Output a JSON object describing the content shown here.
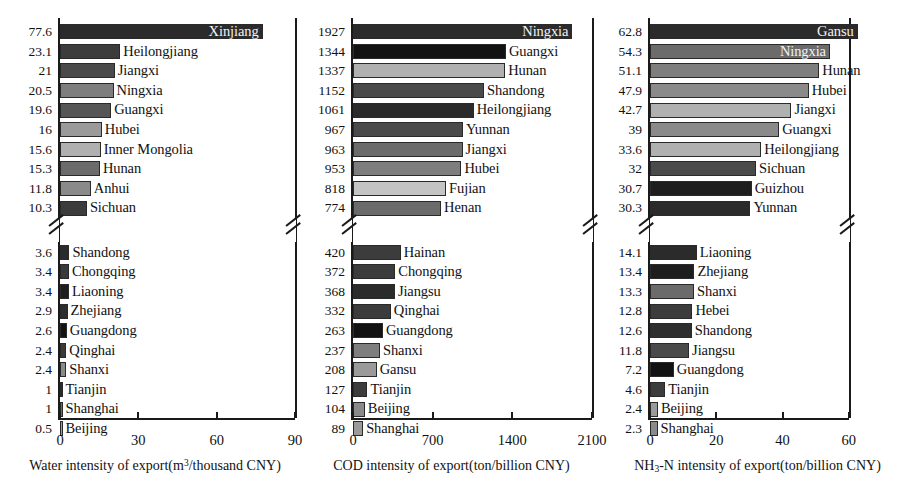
{
  "figure": {
    "background": "#ffffff",
    "n_panels": 3,
    "axis_color": "#1a1a1a"
  },
  "palette": {
    "g1": "#2b2b2b",
    "g2": "#3c3c3c",
    "g3": "#4a4a4a",
    "g4": "#565656",
    "g5": "#6b6b6b",
    "g6": "#7e7e7e",
    "g7": "#9a9a9a",
    "g8": "#b0b0b0",
    "g9": "#c4c4c4",
    "black": "#121212"
  },
  "chart_data": [
    {
      "type": "bar",
      "orientation": "horizontal",
      "id": "water-intensity",
      "title": "",
      "xlabel": "Water intensity of export(m3/thousand CNY)",
      "xlabel_parts": {
        "pre": "Water intensity of export(m",
        "sup": "3",
        "post": "/thousand CNY)"
      },
      "ylabel": "",
      "xlim": [
        0,
        90
      ],
      "xticks": [
        0,
        30,
        60,
        90
      ],
      "xticklabels": [
        "0",
        "30",
        "60",
        "90"
      ],
      "axis_break": true,
      "grid": false,
      "categories": [
        "Xinjiang",
        "Heilongjiang",
        "Jiangxi",
        "Ningxia",
        "Guangxi",
        "Hubei",
        "Inner Mongolia",
        "Hunan",
        "Anhui",
        "Sichuan",
        "Shandong",
        "Chongqing",
        "Liaoning",
        "Zhejiang",
        "Guangdong",
        "Qinghai",
        "Shanxi",
        "Tianjin",
        "Shanghai",
        "Beijing"
      ],
      "values": [
        77.6,
        23.1,
        21,
        20.5,
        19.6,
        16,
        15.6,
        15.3,
        11.8,
        10.3,
        3.6,
        3.4,
        3.4,
        2.9,
        2.6,
        2.4,
        2.4,
        1,
        1,
        0.5
      ],
      "value_labels": [
        "77.6",
        "23.1",
        "21",
        "20.5",
        "19.6",
        "16",
        "15.6",
        "15.3",
        "11.8",
        "10.3",
        "3.6",
        "3.4",
        "3.4",
        "2.9",
        "2.6",
        "2.4",
        "2.4",
        "1",
        "1",
        "0.5"
      ],
      "bar_colors": [
        "#2b2b2b",
        "#3c3c3c",
        "#4a4a4a",
        "#7e7e7e",
        "#565656",
        "#9a9a9a",
        "#b0b0b0",
        "#6b6b6b",
        "#8a8a8a",
        "#3c3c3c",
        "#2b2b2b",
        "#3a3a3a",
        "#1e1e1e",
        "#2e2e2e",
        "#141414",
        "#3a3a3a",
        "#8a8a8a",
        "#2b2b2b",
        "#6b6b6b",
        "#9a9a9a"
      ],
      "label_inside": [
        true,
        false,
        false,
        false,
        false,
        false,
        false,
        false,
        false,
        false,
        false,
        false,
        false,
        false,
        false,
        false,
        false,
        false,
        false,
        false
      ],
      "group_break_after": 9
    },
    {
      "type": "bar",
      "orientation": "horizontal",
      "id": "cod-intensity",
      "title": "",
      "xlabel": "COD intensity of export(ton/billion CNY)",
      "xlabel_parts": {
        "pre": "COD intensity of export(ton/billion CNY)",
        "sup": "",
        "post": ""
      },
      "ylabel": "",
      "xlim": [
        0,
        2100
      ],
      "xticks": [
        0,
        700,
        1400,
        2100
      ],
      "xticklabels": [
        "0",
        "700",
        "1400",
        "2100"
      ],
      "axis_break": true,
      "grid": false,
      "categories": [
        "Ningxia",
        "Guangxi",
        "Hunan",
        "Shandong",
        "Heilongjiang",
        "Yunnan",
        "Jiangxi",
        "Hubei",
        "Fujian",
        "Henan",
        "Hainan",
        "Chongqing",
        "Jiangsu",
        "Qinghai",
        "Guangdong",
        "Shanxi",
        "Gansu",
        "Tianjin",
        "Beijing",
        "Shanghai"
      ],
      "values": [
        1927,
        1344,
        1337,
        1152,
        1061,
        967,
        963,
        953,
        818,
        774,
        420,
        372,
        368,
        332,
        263,
        237,
        208,
        127,
        104,
        89
      ],
      "value_labels": [
        "1927",
        "1344",
        "1337",
        "1152",
        "1061",
        "967",
        "963",
        "953",
        "818",
        "774",
        "420",
        "372",
        "368",
        "332",
        "263",
        "237",
        "208",
        "127",
        "104",
        "89"
      ],
      "bar_colors": [
        "#2b2b2b",
        "#121212",
        "#b0b0b0",
        "#4a4a4a",
        "#2b2b2b",
        "#4a4a4a",
        "#6b6b6b",
        "#7e7e7e",
        "#c4c4c4",
        "#6b6b6b",
        "#3c3c3c",
        "#3c3c3c",
        "#2b2b2b",
        "#3c3c3c",
        "#121212",
        "#7e7e7e",
        "#9a9a9a",
        "#3c3c3c",
        "#8a8a8a",
        "#9a9a9a"
      ],
      "label_inside": [
        true,
        false,
        false,
        false,
        false,
        false,
        false,
        false,
        false,
        false,
        false,
        false,
        false,
        false,
        false,
        false,
        false,
        false,
        false,
        false
      ],
      "group_break_after": 9
    },
    {
      "type": "bar",
      "orientation": "horizontal",
      "id": "nh3n-intensity",
      "title": "",
      "xlabel": "NH3-N intensity of export(ton/billion CNY)",
      "xlabel_parts": {
        "pre": "NH",
        "sub": "3",
        "post": "-N intensity of export(ton/billion CNY)"
      },
      "ylabel": "",
      "xlim": [
        0,
        67
      ],
      "xticks": [
        0,
        20,
        40,
        60
      ],
      "xticklabels": [
        "0",
        "20",
        "40",
        "60"
      ],
      "axis_break": true,
      "grid": false,
      "categories": [
        "Gansu",
        "Ningxia",
        "Hunan",
        "Hubei",
        "Jiangxi",
        "Guangxi",
        "Heilongjiang",
        "Sichuan",
        "Guizhou",
        "Yunnan",
        "Liaoning",
        "Zhejiang",
        "Shanxi",
        "Hebei",
        "Shandong",
        "Jiangsu",
        "Guangdong",
        "Tianjin",
        "Beijing",
        "Shanghai"
      ],
      "values": [
        62.8,
        54.3,
        51.1,
        47.9,
        42.7,
        39,
        33.6,
        32,
        30.7,
        30.3,
        14.1,
        13.4,
        13.3,
        12.8,
        12.6,
        11.8,
        7.2,
        4.6,
        2.4,
        2.3
      ],
      "value_labels": [
        "62.8",
        "54.3",
        "51.1",
        "47.9",
        "42.7",
        "39",
        "33.6",
        "32",
        "30.7",
        "30.3",
        "14.1",
        "13.4",
        "13.3",
        "12.8",
        "12.6",
        "11.8",
        "7.2",
        "4.6",
        "2.4",
        "2.3"
      ],
      "bar_colors": [
        "#2b2b2b",
        "#6b6b6b",
        "#7e7e7e",
        "#8a8a8a",
        "#b0b0b0",
        "#8a8a8a",
        "#b0b0b0",
        "#4a4a4a",
        "#1e1e1e",
        "#2b2b2b",
        "#2b2b2b",
        "#1e1e1e",
        "#6b6b6b",
        "#3c3c3c",
        "#2e2e2e",
        "#4a4a4a",
        "#121212",
        "#3c3c3c",
        "#9a9a9a",
        "#8a8a8a"
      ],
      "label_inside": [
        true,
        true,
        false,
        false,
        false,
        false,
        false,
        false,
        false,
        false,
        false,
        false,
        false,
        false,
        false,
        false,
        false,
        false,
        false,
        false
      ],
      "group_break_after": 9
    }
  ]
}
